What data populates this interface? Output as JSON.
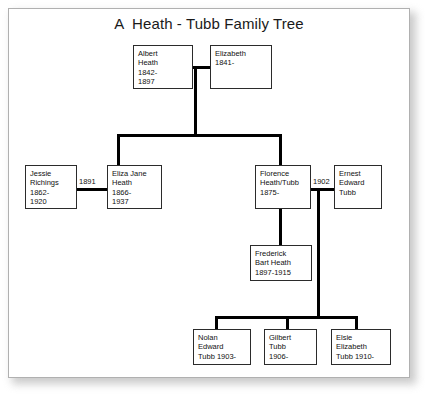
{
  "title": "A  Heath - Tubb Family Tree",
  "colors": {
    "line": "#000000",
    "box_border": "#2b2b2b",
    "frame_border": "#b0b0b0",
    "background": "#ffffff",
    "text": "#111111"
  },
  "people": {
    "albert_heath": {
      "name_line1": "Albert",
      "name_line2": "Heath",
      "dates_line1": "1842-",
      "dates_line2": "1897"
    },
    "elizabeth": {
      "name_line1": "Elizabeth",
      "dates_line1": "1841-"
    },
    "jessie_richings": {
      "name_line1": "Jessie",
      "name_line2": "Richings",
      "dates_line1": "1862-",
      "dates_line2": "1920"
    },
    "eliza_jane_heath": {
      "name_line1": "Eliza Jane",
      "name_line2": "Heath",
      "dates_line1": "1866-",
      "dates_line2": "1937"
    },
    "florence_heath_tubb": {
      "name_line1": "Florence",
      "name_line2": "Heath/Tubb",
      "dates_line1": "1875-"
    },
    "ernest_edward_tubb": {
      "name_line1": "Ernest",
      "name_line2": "Edward",
      "name_line3": "Tubb"
    },
    "frederick_bart_heath": {
      "name_line1": "Frederick",
      "name_line2": "Bart Heath",
      "dates_line1": "1897-1915"
    },
    "nolan_edward_tubb": {
      "name_line1": "Nolan",
      "name_line2": "Edward",
      "name_line3": "Tubb 1903-"
    },
    "gilbert_tubb": {
      "name_line1": "Gilbert",
      "name_line2": "Tubb",
      "dates_line1": "1906-"
    },
    "elsie_elizabeth_tubb": {
      "name_line1": "Elsie",
      "name_line2": "Elizabeth",
      "name_line3": "Tubb 1910-"
    }
  },
  "marriages": {
    "jessie_eliza_year": "1891",
    "florence_ernest_year": "1902"
  }
}
